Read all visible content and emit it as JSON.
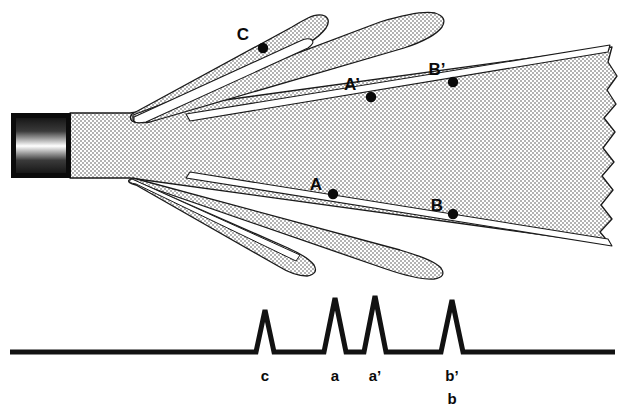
{
  "figure": {
    "type": "acoustic-beam-diagram",
    "colors": {
      "beam_fill": "#d9d9d9",
      "beam_stroke": "#1a1a1a",
      "transducer": "#101010",
      "trace": "#121212",
      "background": "#ffffff"
    }
  },
  "beam_labels": [
    {
      "id": "C",
      "text": "C",
      "x": 243,
      "y": 40,
      "dot_x": 263,
      "dot_y": 48
    },
    {
      "id": "A'",
      "text": "A’",
      "x": 352,
      "y": 90,
      "dot_x": 371,
      "dot_y": 97
    },
    {
      "id": "B'",
      "text": "B’",
      "x": 437,
      "y": 75,
      "dot_x": 453,
      "dot_y": 82
    },
    {
      "id": "A",
      "text": "A",
      "x": 316,
      "y": 190,
      "dot_x": 333,
      "dot_y": 194
    },
    {
      "id": "B",
      "text": "B",
      "x": 437,
      "y": 211,
      "dot_x": 453,
      "dot_y": 214
    }
  ],
  "trace_labels": [
    {
      "id": "c",
      "text": "c",
      "x": 265,
      "y": 381
    },
    {
      "id": "a",
      "text": "a",
      "x": 335,
      "y": 381
    },
    {
      "id": "a'",
      "text": "a’",
      "x": 375,
      "y": 381
    },
    {
      "id": "b'",
      "text": "b’",
      "x": 452,
      "y": 381
    },
    {
      "id": "b",
      "text": "b",
      "x": 452,
      "y": 404
    }
  ],
  "chart_data": {
    "type": "line",
    "title": "",
    "xlabel": "",
    "ylabel": "",
    "baseline_y": 352,
    "x_range": [
      10,
      615
    ],
    "series": [
      {
        "name": "echo-amplitude-trace",
        "peaks": [
          {
            "label": "c",
            "x": 265,
            "height": 42,
            "half_width": 9
          },
          {
            "label": "a",
            "x": 335,
            "height": 54,
            "half_width": 11
          },
          {
            "label": "a'",
            "x": 375,
            "height": 56,
            "half_width": 11
          },
          {
            "label": "b'",
            "x": 452,
            "height": 52,
            "half_width": 11
          }
        ]
      }
    ]
  }
}
